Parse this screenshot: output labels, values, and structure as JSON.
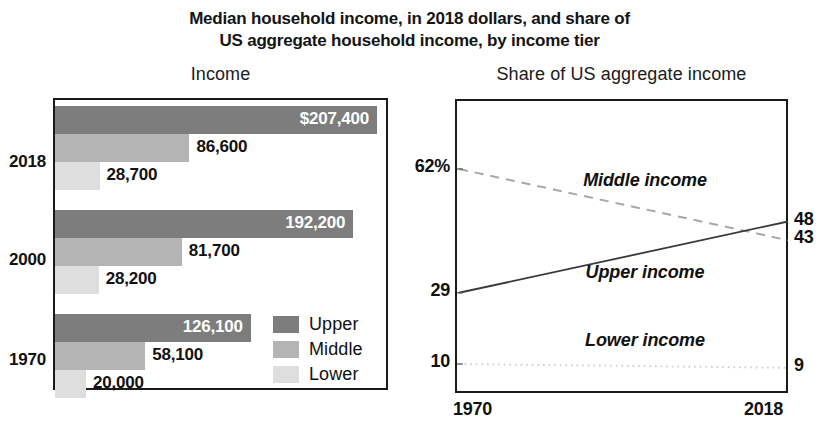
{
  "title": {
    "line1": "Median household income, in 2018 dollars, and share of",
    "line2": "US aggregate household income, by income tier"
  },
  "panels": {
    "left_subtitle": "Income",
    "right_subtitle": "Share of US aggregate income"
  },
  "legend": {
    "items": [
      {
        "label": "Upper",
        "color": "#7d7d7d"
      },
      {
        "label": "Middle",
        "color": "#b4b4b4"
      },
      {
        "label": "Lower",
        "color": "#dedede"
      }
    ]
  },
  "bars": {
    "groups": [
      {
        "year": "2018",
        "rows": [
          {
            "tier": "Upper",
            "value": 207400,
            "label": "$207,400",
            "label_inside": true
          },
          {
            "tier": "Middle",
            "value": 86600,
            "label": "86,600",
            "label_inside": false
          },
          {
            "tier": "Lower",
            "value": 28700,
            "label": "28,700",
            "label_inside": false
          }
        ]
      },
      {
        "year": "2000",
        "rows": [
          {
            "tier": "Upper",
            "value": 192200,
            "label": "192,200",
            "label_inside": true
          },
          {
            "tier": "Middle",
            "value": 81700,
            "label": "81,700",
            "label_inside": false
          },
          {
            "tier": "Lower",
            "value": 28200,
            "label": "28,200",
            "label_inside": false
          }
        ]
      },
      {
        "year": "1970",
        "rows": [
          {
            "tier": "Upper",
            "value": 126100,
            "label": "126,100",
            "label_inside": true
          },
          {
            "tier": "Middle",
            "value": 58100,
            "label": "58,100",
            "label_inside": false
          },
          {
            "tier": "Lower",
            "value": 20000,
            "label": "20,000",
            "label_inside": false
          }
        ]
      }
    ]
  },
  "lines": {
    "y_ticks_left": [
      {
        "label": "62%",
        "value": 62
      },
      {
        "label": "29",
        "value": 29
      },
      {
        "label": "10",
        "value": 10
      }
    ],
    "y_ticks_right": [
      {
        "label": "48",
        "value": 48
      },
      {
        "label": "43",
        "value": 43
      },
      {
        "label": "9",
        "value": 9
      }
    ],
    "x_ticks": [
      {
        "label": "1970"
      },
      {
        "label": "2018"
      }
    ],
    "series": [
      {
        "name": "Middle income",
        "style": "dashed",
        "start": 62,
        "end": 43
      },
      {
        "name": "Upper income",
        "style": "solid",
        "start": 29,
        "end": 48
      },
      {
        "name": "Lower income",
        "style": "dotted",
        "start": 10,
        "end": 9
      }
    ]
  },
  "chart_data": [
    {
      "type": "bar",
      "title": "Income",
      "orientation": "horizontal",
      "xlabel": "",
      "ylabel": "",
      "categories": [
        "2018",
        "2000",
        "1970"
      ],
      "series": [
        {
          "name": "Upper",
          "values": [
            207400,
            86600,
            28700
          ]
        },
        {
          "name": "Middle",
          "values": [
            192200,
            81700,
            28200
          ]
        },
        {
          "name": "Lower",
          "values": [
            126100,
            58100,
            20000
          ]
        }
      ],
      "data_by_year": {
        "2018": {
          "Upper": 207400,
          "Middle": 86600,
          "Lower": 28700
        },
        "2000": {
          "Upper": 192200,
          "Middle": 81700,
          "Lower": 28200
        },
        "1970": {
          "Upper": 126100,
          "Middle": 58100,
          "Lower": 20000
        }
      },
      "value_labels": [
        "$207,400",
        "86,600",
        "28,700",
        "192,200",
        "81,700",
        "28,200",
        "126,100",
        "58,100",
        "20,000"
      ],
      "xlim": [
        0,
        216000
      ],
      "grid": false,
      "legend_position": "inside-bottom-right",
      "units": "2018 dollars"
    },
    {
      "type": "line",
      "title": "Share of US aggregate income",
      "xlabel": "",
      "ylabel": "",
      "x": [
        1970,
        2018
      ],
      "series": [
        {
          "name": "Middle income",
          "values": [
            62,
            43
          ],
          "style": "dashed"
        },
        {
          "name": "Upper income",
          "values": [
            29,
            48
          ],
          "style": "solid"
        },
        {
          "name": "Lower income",
          "values": [
            10,
            9
          ],
          "style": "dotted"
        }
      ],
      "xlim": [
        1970,
        2018
      ],
      "ylim": [
        0,
        72
      ],
      "ytick_labels_left": [
        "62%",
        "29",
        "10"
      ],
      "ytick_labels_right": [
        "48",
        "43",
        "9"
      ],
      "xtick_labels": [
        "1970",
        "2018"
      ],
      "grid": false,
      "legend_position": "inline-annotations",
      "units": "percent"
    }
  ]
}
